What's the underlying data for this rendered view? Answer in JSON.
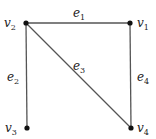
{
  "graph": {
    "vertices": [
      {
        "id": "v1",
        "name": "v",
        "sub": "1",
        "x": 130,
        "y": 23,
        "lx": 137,
        "ly": 27
      },
      {
        "id": "v2",
        "name": "v",
        "sub": "2",
        "x": 26,
        "y": 23,
        "lx": 4,
        "ly": 27
      },
      {
        "id": "v3",
        "name": "v",
        "sub": "3",
        "x": 27,
        "y": 128,
        "lx": 5,
        "ly": 132
      },
      {
        "id": "v4",
        "name": "v",
        "sub": "4",
        "x": 131,
        "y": 128,
        "lx": 137,
        "ly": 132
      }
    ],
    "edges": [
      {
        "id": "e1",
        "name": "e",
        "sub": "1",
        "from": "v2",
        "to": "v1",
        "lx": 73,
        "ly": 17
      },
      {
        "id": "e2",
        "name": "e",
        "sub": "2",
        "from": "v2",
        "to": "v3",
        "lx": 7,
        "ly": 81
      },
      {
        "id": "e3",
        "name": "e",
        "sub": "3",
        "from": "v2",
        "to": "v4",
        "lx": 73,
        "ly": 70
      },
      {
        "id": "e4",
        "name": "e",
        "sub": "4",
        "from": "v1",
        "to": "v4",
        "lx": 137,
        "ly": 81
      }
    ],
    "colors": {
      "edge": "#555555",
      "vertex": "#111111",
      "label": "#222222"
    }
  }
}
